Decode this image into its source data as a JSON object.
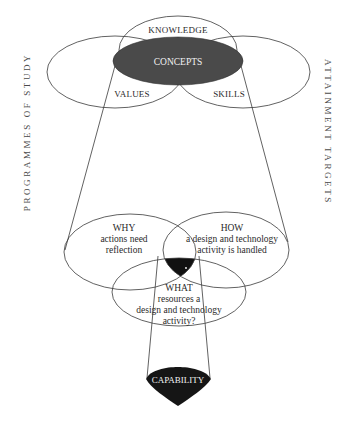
{
  "side_labels": {
    "left": "PROGRAMMES OF STUDY",
    "right": "ATTAINMENT TARGETS"
  },
  "top_venn": {
    "knowledge": "KNOWLEDGE",
    "concepts": "CONCEPTS",
    "values": "VALUES",
    "skills": "SKILLS"
  },
  "middle_venn": {
    "why": {
      "title": "WHY",
      "line1": "actions need",
      "line2": "reflection"
    },
    "how": {
      "title": "HOW",
      "line1": "a design and technology",
      "line2": "activity is handled"
    },
    "what": {
      "title": "WHAT",
      "line1": "resources a",
      "line2": "design and technology",
      "line3": "activity?"
    }
  },
  "bottom": {
    "capability": "CAPABILITY"
  },
  "colors": {
    "concepts_fill": "#4a4a4a",
    "intersection_fill": "#111111",
    "capability_fill": "#151515",
    "line": "#3a3a3a"
  }
}
